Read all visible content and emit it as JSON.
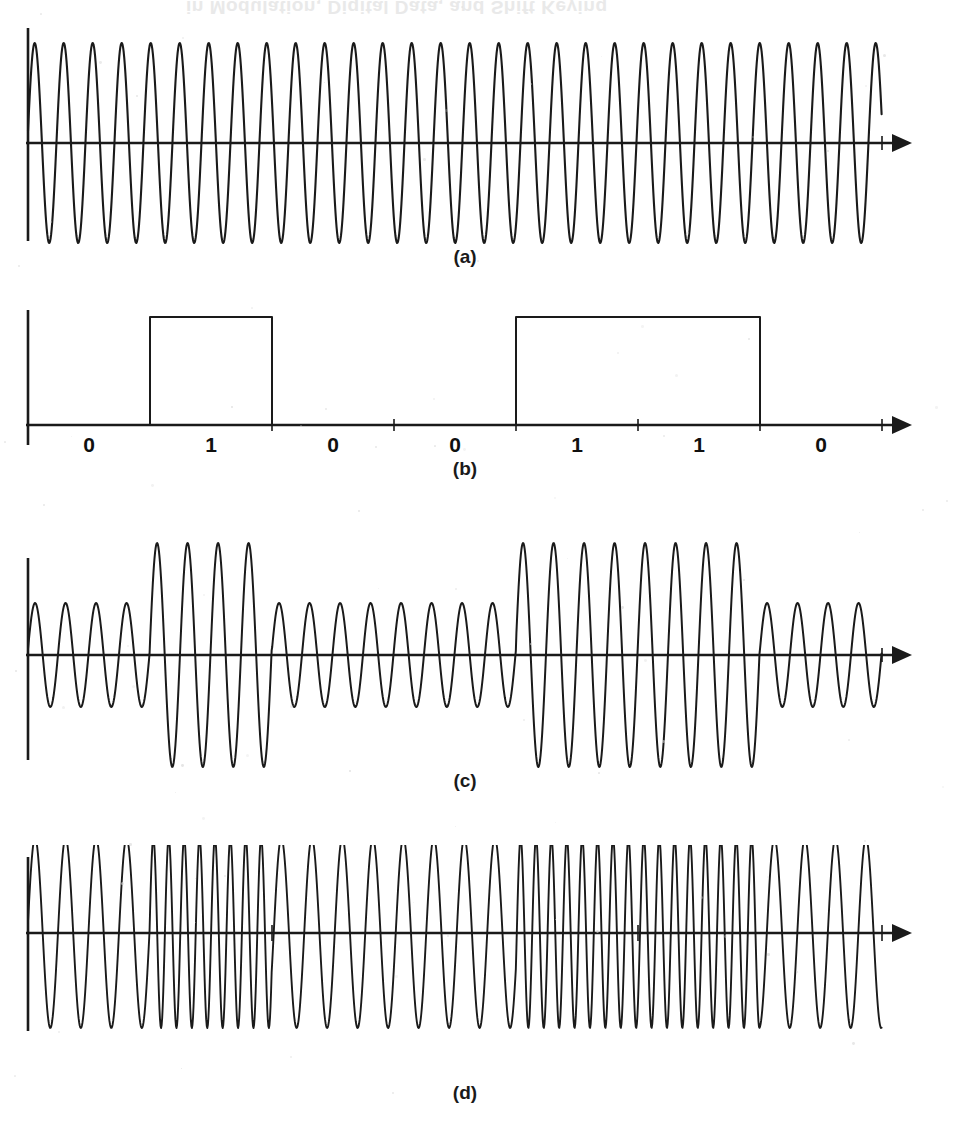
{
  "figure": {
    "background_color": "#ffffff",
    "ink_color": "#1a1a1a",
    "bleed_through_text": "in Modulation, Digital Data, and Shift Keying",
    "panel_labels": [
      "(a)",
      "(b)",
      "(c)",
      "(d)"
    ],
    "axis_arrow": "arrow-right"
  },
  "timebase": {
    "origin_x": 28,
    "bit_width": 122,
    "bit_count": 7,
    "signal_end_x": 882,
    "axis_end_x": 912,
    "tick_marks_x": [
      272,
      394,
      516,
      638,
      760,
      882
    ]
  },
  "panels": [
    {
      "id": "a",
      "label": "(a)",
      "name": "carrier-waveform",
      "description": "Unmodulated carrier sine wave, constant amplitude and constant frequency",
      "kind": "sine-constant",
      "baseline_y": 143,
      "amplitude": 100,
      "period_px": 29,
      "label_x": 465,
      "label_y": 246
    },
    {
      "id": "b",
      "label": "(b)",
      "name": "digital-data-waveform",
      "description": "Binary unipolar NRZ data stream",
      "kind": "square",
      "baseline_y": 425,
      "pulse_height": 108,
      "bits": [
        0,
        1,
        0,
        0,
        1,
        1,
        0
      ],
      "bit_labels": [
        "0",
        "1",
        "0",
        "0",
        "1",
        "1",
        "0"
      ],
      "label_x": 465,
      "label_y": 458
    },
    {
      "id": "c",
      "label": "(c)",
      "name": "ask-waveform",
      "description": "Amplitude shift keying: large amplitude for 1, small amplitude for 0",
      "kind": "ask",
      "baseline_y": 655,
      "amplitude_high": 112,
      "amplitude_low": 52,
      "period_px": 30.5,
      "label_x": 465,
      "label_y": 770
    },
    {
      "id": "d",
      "label": "(d)",
      "name": "fsk-waveform",
      "description": "Frequency shift keying: high frequency for 1, low frequency for 0, constant amplitude",
      "kind": "fsk",
      "baseline_y": 933,
      "amplitude": 95,
      "period_low_px": 30.5,
      "period_high_px": 15.4,
      "label_x": 465,
      "label_y": 1082
    }
  ],
  "chart_data": {
    "type": "line",
    "xlabel": "",
    "ylabel": "",
    "grid": false,
    "legend": "none",
    "x": [
      0,
      1,
      2,
      3,
      4,
      5,
      6,
      7
    ],
    "categories": [
      "bit 1",
      "bit 2",
      "bit 3",
      "bit 4",
      "bit 5",
      "bit 6",
      "bit 7"
    ],
    "series": [
      {
        "name": "(a) carrier",
        "type": "sine",
        "amplitude_per_bit": [
          1,
          1,
          1,
          1,
          1,
          1,
          1
        ],
        "relative_frequency_per_bit": [
          1,
          1,
          1,
          1,
          1,
          1,
          1
        ]
      },
      {
        "name": "(b) digital data",
        "type": "square",
        "values": [
          0,
          1,
          0,
          0,
          1,
          1,
          0
        ]
      },
      {
        "name": "(c) ASK",
        "type": "sine",
        "amplitude_per_bit": [
          0.46,
          1,
          0.46,
          0.46,
          1,
          1,
          0.46
        ],
        "relative_frequency_per_bit": [
          1,
          1,
          1,
          1,
          1,
          1,
          1
        ]
      },
      {
        "name": "(d) FSK",
        "type": "sine",
        "amplitude_per_bit": [
          1,
          1,
          1,
          1,
          1,
          1,
          1
        ],
        "relative_frequency_per_bit": [
          1,
          2,
          1,
          1,
          2,
          2,
          1
        ]
      }
    ]
  }
}
